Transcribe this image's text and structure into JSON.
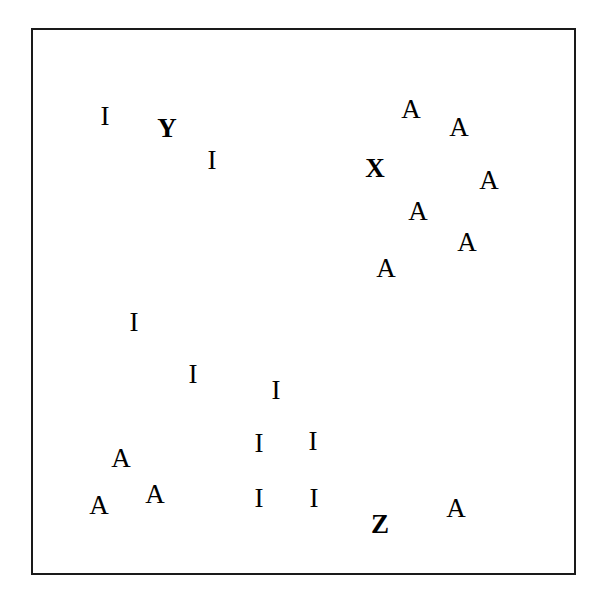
{
  "figure": {
    "background_color": "#ffffff",
    "width": 596,
    "height": 601
  },
  "frame": {
    "label": "plot border",
    "x": 31,
    "y": 28,
    "width": 545,
    "height": 547,
    "border_width": 2,
    "border_color": "#1a1a1a",
    "fill_color": "#ffffff"
  },
  "chart_data": {
    "type": "scatter",
    "xlabel": "",
    "ylabel": "",
    "xlim": [
      31,
      576
    ],
    "ylim": [
      28,
      575
    ],
    "grid": false,
    "legend": null,
    "axis_ticks": [],
    "marker_kind": "text-glyph",
    "categories": [
      "A",
      "I",
      "X",
      "Y",
      "Z"
    ],
    "category_counts": {
      "A": 10,
      "I": 11,
      "X": 1,
      "Y": 1,
      "Z": 1
    },
    "total_points": 24,
    "points": [
      {
        "label": "I",
        "x": 105,
        "y": 116,
        "size": 27,
        "weight": "regular"
      },
      {
        "label": "Y",
        "x": 167,
        "y": 128,
        "size": 27,
        "weight": "bold"
      },
      {
        "label": "I",
        "x": 212,
        "y": 160,
        "size": 27,
        "weight": "regular"
      },
      {
        "label": "A",
        "x": 411,
        "y": 109,
        "size": 27,
        "weight": "regular"
      },
      {
        "label": "A",
        "x": 459,
        "y": 127,
        "size": 27,
        "weight": "regular"
      },
      {
        "label": "X",
        "x": 375,
        "y": 168,
        "size": 27,
        "weight": "bold"
      },
      {
        "label": "A",
        "x": 489,
        "y": 180,
        "size": 27,
        "weight": "regular"
      },
      {
        "label": "A",
        "x": 418,
        "y": 211,
        "size": 27,
        "weight": "regular"
      },
      {
        "label": "A",
        "x": 467,
        "y": 242,
        "size": 27,
        "weight": "regular"
      },
      {
        "label": "A",
        "x": 386,
        "y": 268,
        "size": 27,
        "weight": "regular"
      },
      {
        "label": "I",
        "x": 134,
        "y": 322,
        "size": 27,
        "weight": "regular"
      },
      {
        "label": "I",
        "x": 193,
        "y": 374,
        "size": 27,
        "weight": "regular"
      },
      {
        "label": "I",
        "x": 276,
        "y": 390,
        "size": 27,
        "weight": "regular"
      },
      {
        "label": "A",
        "x": 121,
        "y": 458,
        "size": 27,
        "weight": "regular"
      },
      {
        "label": "I",
        "x": 259,
        "y": 443,
        "size": 27,
        "weight": "regular"
      },
      {
        "label": "I",
        "x": 313,
        "y": 441,
        "size": 27,
        "weight": "regular"
      },
      {
        "label": "A",
        "x": 99,
        "y": 505,
        "size": 27,
        "weight": "regular"
      },
      {
        "label": "A",
        "x": 155,
        "y": 494,
        "size": 27,
        "weight": "regular"
      },
      {
        "label": "I",
        "x": 259,
        "y": 498,
        "size": 27,
        "weight": "regular"
      },
      {
        "label": "I",
        "x": 314,
        "y": 498,
        "size": 27,
        "weight": "regular"
      },
      {
        "label": "Z",
        "x": 380,
        "y": 524,
        "size": 27,
        "weight": "bold"
      },
      {
        "label": "A",
        "x": 456,
        "y": 508,
        "size": 27,
        "weight": "regular"
      }
    ]
  }
}
